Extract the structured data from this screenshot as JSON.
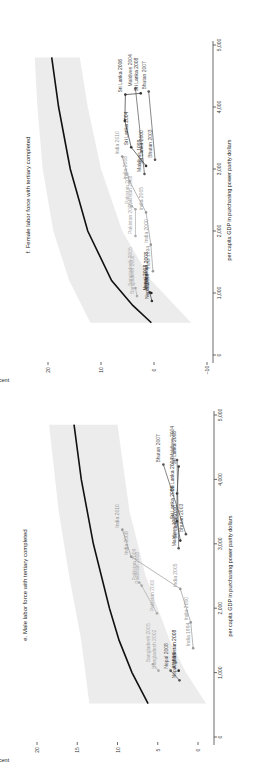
{
  "chart_data": [
    {
      "id": "f",
      "type": "scatter",
      "title": "f. Female labor force with tertiary completed",
      "xlabel": "per capita GDP in purchasing power parity dollars",
      "ylabel": "percent",
      "xlim": [
        0,
        5000
      ],
      "ylim": [
        -10,
        22
      ],
      "xticks": [
        0,
        1000,
        2000,
        3000,
        4000,
        5000
      ],
      "xtick_labels": [
        "0",
        "1,000",
        "2,000",
        "3,000",
        "4,000",
        "5,000"
      ],
      "yticks": [
        -10,
        0,
        10,
        20
      ],
      "ytick_labels": [
        "–10",
        "0",
        "10",
        "20"
      ],
      "grid": false,
      "rotation": "90deg-clockwise",
      "fit_curve": [
        [
          520,
          0.5
        ],
        [
          800,
          4
        ],
        [
          1200,
          8
        ],
        [
          2000,
          12.5
        ],
        [
          3000,
          15.8
        ],
        [
          4000,
          18
        ],
        [
          4800,
          19.3
        ]
      ],
      "band_upper": [
        [
          520,
          12
        ],
        [
          1200,
          16
        ],
        [
          2000,
          19
        ],
        [
          3000,
          21
        ],
        [
          4000,
          22
        ],
        [
          4800,
          22.5
        ]
      ],
      "band_lower": [
        [
          520,
          -7
        ],
        [
          1200,
          0.5
        ],
        [
          2000,
          6
        ],
        [
          3000,
          10
        ],
        [
          4000,
          12.5
        ],
        [
          4800,
          14
        ]
      ],
      "series": [
        {
          "name": "Sri Lanka",
          "color": "#333333",
          "points": [
            {
              "x": 3050,
              "y": 1.5,
              "label": "Sri Lanka 2000"
            },
            {
              "x": 3350,
              "y": 4.3,
              "label": "Sri Lanka 2004"
            },
            {
              "x": 3780,
              "y": 5.5,
              "label": ""
            },
            {
              "x": 4200,
              "y": 5.4,
              "label": "Sri Lanka 2006"
            },
            {
              "x": 4220,
              "y": 2.5,
              "label": "Sri Lanka 2008"
            }
          ]
        },
        {
          "name": "Maldives",
          "color": "#555555",
          "points": [
            {
              "x": 2920,
              "y": 1.8,
              "label": "Maldives 1998"
            },
            {
              "x": 4300,
              "y": 3.5,
              "label": "Maldives 2004"
            }
          ]
        },
        {
          "name": "Bhutan",
          "color": "#555555",
          "points": [
            {
              "x": 3150,
              "y": -0.2,
              "label": "Bhutan 2003"
            },
            {
              "x": 4250,
              "y": 1.0,
              "label": "Bhutan 2007"
            }
          ]
        },
        {
          "name": "India",
          "color": "#999999",
          "points": [
            {
              "x": 1350,
              "y": 0.2,
              "label": "India 1994"
            },
            {
              "x": 1780,
              "y": 0.6,
              "label": "India 2000"
            },
            {
              "x": 2300,
              "y": 1.5,
              "label": "India 2005"
            },
            {
              "x": 2800,
              "y": 4.6,
              "label": "India 2008"
            },
            {
              "x": 3200,
              "y": 6.0,
              "label": "India 2010"
            }
          ]
        },
        {
          "name": "Pakistan",
          "color": "#aaaaaa",
          "points": [
            {
              "x": 1920,
              "y": 3.5,
              "label": "Pakistan 2000"
            },
            {
              "x": 2350,
              "y": 3.5,
              "label": "Pakistan 2008"
            },
            {
              "x": 2400,
              "y": 4.2,
              "label": "Pakistan 2009"
            }
          ]
        },
        {
          "name": "Bangladesh",
          "color": "#aaaaaa",
          "points": [
            {
              "x": 950,
              "y": 3.2,
              "label": "Bangladesh 2002"
            },
            {
              "x": 1080,
              "y": 3.5,
              "label": "Bangladesh 2005"
            }
          ]
        },
        {
          "name": "Nepal",
          "color": "#333333",
          "points": [
            {
              "x": 870,
              "y": 0.4,
              "label": "Nepal 1999"
            },
            {
              "x": 1010,
              "y": 0.8,
              "label": "Nepal 2008"
            }
          ]
        },
        {
          "name": "Afghanistan",
          "color": "#222222",
          "points": [
            {
              "x": 1000,
              "y": 0.5,
              "label": "Afghanistan 2008"
            }
          ]
        }
      ]
    },
    {
      "id": "e",
      "type": "scatter",
      "title": "e. Male labor force with tertiary completed",
      "xlabel": "per capita GDP in purchasing power parity dollars",
      "ylabel": "percent",
      "xlim": [
        0,
        5000
      ],
      "ylim": [
        -1,
        20
      ],
      "xticks": [
        0,
        1000,
        2000,
        3000,
        4000,
        5000
      ],
      "xtick_labels": [
        "0",
        "1,000",
        "2,000",
        "3,000",
        "4,000",
        "5,000"
      ],
      "yticks": [
        0,
        5,
        10,
        15,
        20
      ],
      "ytick_labels": [
        "0",
        "5",
        "10",
        "15",
        "20"
      ],
      "grid": false,
      "rotation": "90deg-clockwise",
      "fit_curve": [
        [
          520,
          6.2
        ],
        [
          1000,
          8.2
        ],
        [
          1500,
          9.8
        ],
        [
          2000,
          11.0
        ],
        [
          3000,
          13.0
        ],
        [
          4000,
          14.5
        ],
        [
          4850,
          15.4
        ]
      ],
      "band_upper": [
        [
          520,
          13.5
        ],
        [
          1500,
          14.5
        ],
        [
          2500,
          16
        ],
        [
          3500,
          17.3
        ],
        [
          4850,
          18.5
        ]
      ],
      "band_lower": [
        [
          520,
          -1
        ],
        [
          1000,
          1.5
        ],
        [
          1500,
          3.5
        ],
        [
          2500,
          6.5
        ],
        [
          3500,
          8.5
        ],
        [
          4850,
          10
        ]
      ],
      "series": [
        {
          "name": "Sri Lanka",
          "color": "#333333",
          "points": [
            {
              "x": 3050,
              "y": 2.2,
              "label": "Sri Lanka 2000"
            },
            {
              "x": 3350,
              "y": 2.6,
              "label": "Sri Lanka 2006"
            },
            {
              "x": 3780,
              "y": 2.6,
              "label": "Sri Lanka 2004"
            },
            {
              "x": 4200,
              "y": 2.4,
              "label": "Sri Lanka 2008"
            }
          ]
        },
        {
          "name": "Maldives",
          "color": "#555555",
          "points": [
            {
              "x": 2930,
              "y": 2.4,
              "label": "Maldives 1998"
            },
            {
              "x": 4300,
              "y": 2.6,
              "label": "Maldives 2004"
            }
          ]
        },
        {
          "name": "Bhutan",
          "color": "#555555",
          "points": [
            {
              "x": 3150,
              "y": 1.5,
              "label": "Bhutan 2003"
            },
            {
              "x": 4230,
              "y": 4.3,
              "label": "Bhutan 2007"
            }
          ]
        },
        {
          "name": "India",
          "color": "#999999",
          "points": [
            {
              "x": 1380,
              "y": 0.6,
              "label": "India 1994"
            },
            {
              "x": 1780,
              "y": 0.9,
              "label": "India 2000"
            },
            {
              "x": 2300,
              "y": 2.2,
              "label": "India 2005"
            },
            {
              "x": 2800,
              "y": 8.3,
              "label": "India 2008"
            },
            {
              "x": 3220,
              "y": 9.4,
              "label": "India 2010"
            }
          ]
        },
        {
          "name": "Pakistan",
          "color": "#aaaaaa",
          "points": [
            {
              "x": 1920,
              "y": 5.1,
              "label": "Pakistan 2000"
            },
            {
              "x": 2350,
              "y": 7.0,
              "label": "Pakistan 2008"
            },
            {
              "x": 2400,
              "y": 7.3,
              "label": "Pakistan 2009"
            }
          ]
        },
        {
          "name": "Bangladesh",
          "color": "#aaaaaa",
          "points": [
            {
              "x": 1030,
              "y": 4.9,
              "label": "Bangladesh 2002"
            },
            {
              "x": 1130,
              "y": 5.6,
              "label": "Bangladesh 2005"
            }
          ]
        },
        {
          "name": "Nepal",
          "color": "#555555",
          "points": [
            {
              "x": 880,
              "y": 2.3,
              "label": "Nepal 1999"
            },
            {
              "x": 1030,
              "y": 3.4,
              "label": "Nepal 2008"
            }
          ]
        },
        {
          "name": "Afghanistan",
          "color": "#222222",
          "points": [
            {
              "x": 1030,
              "y": 2.4,
              "label": "Afghanistan 2008"
            }
          ]
        }
      ]
    }
  ]
}
